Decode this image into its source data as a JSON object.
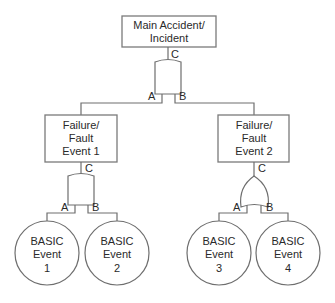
{
  "diagram": {
    "type": "fault-tree",
    "top_event": {
      "lines": [
        "Main Accident/",
        "Incident"
      ],
      "gate": {
        "type": "AND",
        "output_label": "C",
        "input_labels": [
          "A",
          "B"
        ]
      }
    },
    "intermediate_events": [
      {
        "lines": [
          "Failure/",
          "Fault",
          "Event 1"
        ],
        "gate": {
          "type": "AND",
          "output_label": "C",
          "input_labels": [
            "A",
            "B"
          ]
        },
        "children": [
          {
            "lines": [
              "BASIC",
              "Event",
              "1"
            ]
          },
          {
            "lines": [
              "BASIC",
              "Event",
              "2"
            ]
          }
        ]
      },
      {
        "lines": [
          "Failure/",
          "Fault",
          "Event 2"
        ],
        "gate": {
          "type": "OR",
          "output_label": "C",
          "input_labels": [
            "A",
            "B"
          ]
        },
        "children": [
          {
            "lines": [
              "BASIC",
              "Event",
              "3"
            ]
          },
          {
            "lines": [
              "BASIC",
              "Event",
              "4"
            ]
          }
        ]
      }
    ]
  }
}
